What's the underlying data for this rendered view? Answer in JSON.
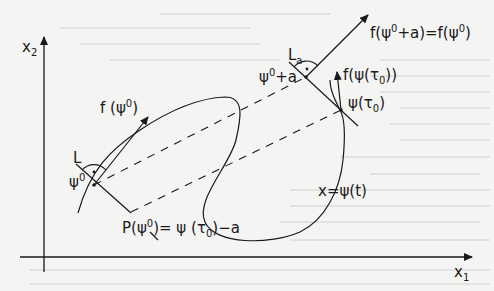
{
  "figure": {
    "axes": {
      "x_label": "x",
      "x_label_sub": "1",
      "y_label": "x",
      "y_label_sub": "2"
    },
    "curve_label": "x=ψ(t)",
    "points": {
      "psi0": {
        "base": "ψ",
        "sup": "0"
      },
      "psi0_plus_a": {
        "base": "ψ",
        "sup": "0",
        "suffix": "+a"
      },
      "psi_tau0": "ψ(τ",
      "psi_tau0_sub": "0",
      "psi_tau0_close": ")"
    },
    "vectors": {
      "f_psi0": {
        "prefix": "f (ψ",
        "sup": "0",
        "suffix": ")"
      },
      "f_psi0_plus_a": {
        "prefix": "f(ψ",
        "sup1": "0",
        "mid": "+a)=f(ψ",
        "sup2": "0",
        "suffix": ")"
      },
      "f_psi_tau0": {
        "prefix": "f(ψ(τ",
        "sub": "0",
        "suffix": "))"
      }
    },
    "lines": {
      "L": "L",
      "La": "L",
      "La_sub": "a"
    },
    "poincare_map": {
      "prefix": "P(ψ",
      "sup": "0",
      "mid": ")= ψ (τ",
      "sub": "0",
      "suffix": ")−a"
    }
  },
  "colors": {
    "ink": "#1a1a1a",
    "paper": "#f4f4f2",
    "bleed_text": "#bdbdbd"
  }
}
